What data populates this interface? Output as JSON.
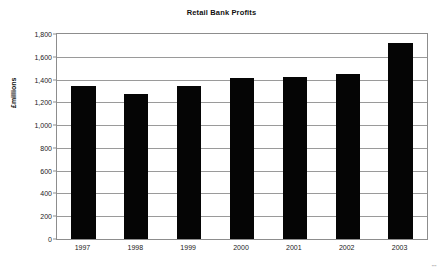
{
  "chart_data": {
    "type": "bar",
    "title": "Retail Bank Profits",
    "xlabel": "",
    "ylabel": "£millions",
    "categories": [
      "1997",
      "1998",
      "1999",
      "2000",
      "2001",
      "2002",
      "2003"
    ],
    "values": [
      1340,
      1270,
      1340,
      1410,
      1420,
      1445,
      1725
    ],
    "series": [
      {
        "name": "Retail Bank Profits",
        "values": [
          1340,
          1270,
          1340,
          1410,
          1420,
          1445,
          1725
        ],
        "color": "#050505"
      }
    ],
    "ylim": [
      0,
      1800
    ],
    "ytick_step": 200,
    "ytick_labels": [
      "0",
      "200",
      "400",
      "600",
      "800",
      "1,000",
      "1,200",
      "1,400",
      "1,600",
      "1,800"
    ],
    "ytick_values": [
      0,
      200,
      400,
      600,
      800,
      1000,
      1200,
      1400,
      1600,
      1800
    ],
    "grid": true,
    "grid_axis": "y",
    "legend": false,
    "legend_position": "none",
    "bar_color": "#050505",
    "gridline_color": "#9a9a9a",
    "axis_color": "#8d8d8d",
    "background": "#ffffff"
  },
  "page": {
    "corner_mark": "\"\""
  }
}
